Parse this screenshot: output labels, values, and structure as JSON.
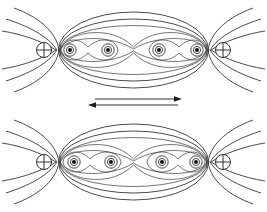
{
  "figure": {
    "title": "Covalent bond electron density contour diagram",
    "caption": "",
    "background_color": "#ffffff",
    "line_color": "#2b2b2b",
    "width": 267,
    "height": 212
  },
  "panels": [
    {
      "id": "top-panel",
      "label": "",
      "center_y": 50,
      "nuclei": [
        {
          "label": "+",
          "symbol": "circled-plus",
          "cx": 44,
          "cy": 50,
          "r": 7.5
        },
        {
          "label": "+",
          "symbol": "circled-plus",
          "cx": 223,
          "cy": 50,
          "r": 7.5
        }
      ],
      "electrons": [
        {
          "label": "",
          "cx": 70,
          "cy": 50,
          "core_r": 2.0,
          "rings": [
            3.6,
            6.2
          ]
        },
        {
          "label": "",
          "cx": 108,
          "cy": 50,
          "core_r": 2.0,
          "rings": [
            3.6,
            6.2
          ]
        },
        {
          "label": "",
          "cx": 159,
          "cy": 50,
          "core_r": 2.0,
          "rings": [
            3.6,
            6.2
          ]
        },
        {
          "label": "",
          "cx": 197,
          "cy": 50,
          "core_r": 2.0,
          "rings": [
            3.6,
            6.2
          ]
        }
      ],
      "envelope": {
        "cx": 133.5,
        "cy": 50,
        "rx": 75,
        "ry": 38
      }
    },
    {
      "id": "bottom-panel",
      "label": "",
      "center_y": 162,
      "nuclei": [
        {
          "label": "+",
          "symbol": "circled-plus",
          "cx": 44,
          "cy": 162,
          "r": 7.5
        },
        {
          "label": "+",
          "symbol": "circled-plus",
          "cx": 223,
          "cy": 162,
          "r": 7.5
        }
      ],
      "electrons": [
        {
          "label": "",
          "cx": 74,
          "cy": 162,
          "core_r": 2.0,
          "rings": [
            3.6,
            6.2
          ]
        },
        {
          "label": "",
          "cx": 111,
          "cy": 162,
          "core_r": 2.0,
          "rings": [
            3.6,
            6.2
          ]
        },
        {
          "label": "",
          "cx": 162,
          "cy": 162,
          "core_r": 2.0,
          "rings": [
            3.6,
            6.2
          ]
        },
        {
          "label": "",
          "cx": 196,
          "cy": 162,
          "core_r": 2.0,
          "rings": [
            3.6,
            6.2
          ]
        }
      ],
      "envelope": {
        "cx": 133.5,
        "cy": 162,
        "rx": 75,
        "ry": 38
      }
    }
  ],
  "arrows": [
    {
      "id": "arrow-right",
      "label": "",
      "direction": "right",
      "x_start": 95,
      "x_end": 182,
      "y": 99
    },
    {
      "id": "arrow-left",
      "label": "",
      "direction": "left",
      "x_start": 178,
      "x_end": 88,
      "y": 105
    }
  ],
  "legend": {
    "nucleus_symbol": "⊕",
    "nucleus_name": "nucleus-positive-charge",
    "electron_name": "electron-density-point"
  }
}
